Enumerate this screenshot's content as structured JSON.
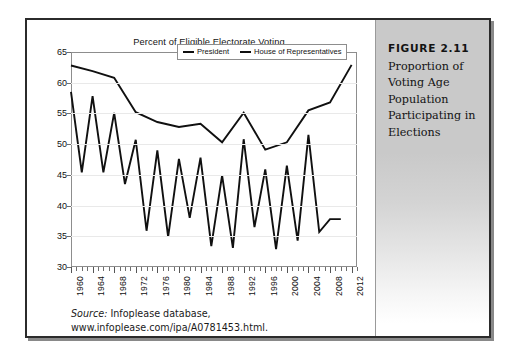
{
  "figure": {
    "label": "FIGURE 2.11",
    "caption": "Proportion of Voting Age Population Participating in Elections"
  },
  "source": {
    "prefix": "Source:",
    "line1": " Infoplease database,",
    "line2": "www.infoplease.com/ipa/A0781453.html."
  },
  "chart_data": {
    "type": "line",
    "title": "Percent of Eligible Electorate Voting",
    "xlabel": "",
    "ylabel": "",
    "xlim": [
      1960,
      2013
    ],
    "ylim": [
      30,
      65
    ],
    "yticks": [
      30,
      35,
      40,
      45,
      50,
      55,
      60,
      65
    ],
    "xticks": [
      1960,
      1964,
      1968,
      1972,
      1976,
      1980,
      1984,
      1988,
      1992,
      1996,
      2000,
      2004,
      2008,
      2012
    ],
    "grid": true,
    "legend_position": "top-center",
    "series": [
      {
        "name": "President",
        "x": [
          1960,
          1964,
          1968,
          1972,
          1976,
          1980,
          1984,
          1988,
          1992,
          1996,
          2000,
          2004,
          2008,
          2012
        ],
        "values": [
          62.8,
          61.9,
          60.8,
          55.2,
          53.6,
          52.8,
          53.3,
          50.3,
          55.1,
          49.1,
          50.3,
          55.5,
          56.8,
          62.9
        ]
      },
      {
        "name": "House of Representatives",
        "x": [
          1960,
          1962,
          1964,
          1966,
          1968,
          1970,
          1972,
          1974,
          1976,
          1978,
          1980,
          1982,
          1984,
          1986,
          1988,
          1990,
          1992,
          1994,
          1996,
          1998,
          2000,
          2002,
          2004,
          2006,
          2008,
          2010
        ],
        "values": [
          58.5,
          45.4,
          57.8,
          45.4,
          55.1,
          43.5,
          50.7,
          35.9,
          49.0,
          34.9,
          47.6,
          38.0,
          47.8,
          33.4,
          44.9,
          33.1,
          50.8,
          36.5,
          45.9,
          32.9,
          46.5,
          34.3,
          51.5,
          35.7,
          37.8,
          37.8
        ]
      }
    ]
  }
}
